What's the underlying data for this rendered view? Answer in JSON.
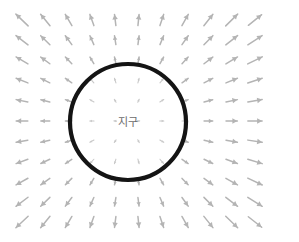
{
  "figure": {
    "title": "",
    "background_color": "#ffffff",
    "width": 299,
    "height": 242
  },
  "body_label": {
    "text": "지구",
    "color": "#6b6b6b",
    "x": 128,
    "y": 122
  },
  "circle": {
    "name": "earth-boundary",
    "cx": 128,
    "cy": 122,
    "r": 58,
    "stroke_color": "#141414",
    "stroke_width": 4.2,
    "fill": "none"
  },
  "vector_field": {
    "type": "radial-outward",
    "arrow_color": "#b4b4b4",
    "arrow_color_inner": "#c9c9c9",
    "grid": {
      "columns": 11,
      "rows": 11,
      "x_start": 22,
      "x_step": 23.3,
      "y_start": 20,
      "y_step": 20.2
    },
    "center": {
      "x": 128,
      "y": 122
    },
    "magnitude_model": "inverse-square-clamped",
    "max_arrow_length": 17,
    "min_arrow_length": 2,
    "samples": [
      {
        "col": 0,
        "row": 0,
        "x": 22,
        "y": 20,
        "angle_deg": 223,
        "length": 13
      },
      {
        "col": 5,
        "row": 0,
        "x": 138,
        "y": 20,
        "angle_deg": 275,
        "length": 11
      },
      {
        "col": 10,
        "row": 0,
        "x": 255,
        "y": 20,
        "angle_deg": 316,
        "length": 13
      },
      {
        "col": 0,
        "row": 5,
        "x": 22,
        "y": 122,
        "angle_deg": 180,
        "length": 16
      },
      {
        "col": 4,
        "row": 5,
        "x": 115,
        "y": 122,
        "angle_deg": 180,
        "length": 4
      },
      {
        "col": 6,
        "row": 5,
        "x": 162,
        "y": 122,
        "angle_deg": 0,
        "length": 5
      },
      {
        "col": 10,
        "row": 5,
        "x": 255,
        "y": 122,
        "angle_deg": 0,
        "length": 16
      },
      {
        "col": 0,
        "row": 10,
        "x": 22,
        "y": 222,
        "angle_deg": 137,
        "length": 13
      },
      {
        "col": 5,
        "row": 10,
        "x": 138,
        "y": 222,
        "angle_deg": 84,
        "length": 11
      },
      {
        "col": 10,
        "row": 10,
        "x": 255,
        "y": 222,
        "angle_deg": 44,
        "length": 13
      }
    ]
  }
}
